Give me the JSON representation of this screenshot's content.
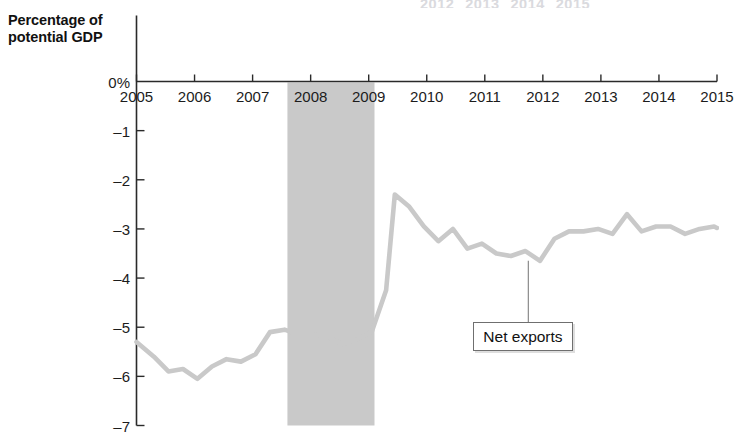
{
  "chart_data": {
    "type": "line",
    "title": "",
    "ylabel": "Percentage of potential GDP",
    "xlabel": "",
    "ylim": [
      -7,
      0
    ],
    "xlim": [
      2005,
      2015
    ],
    "grid": false,
    "legend_position": "inline-callout",
    "y_ticks": [
      "0%",
      "–1",
      "–2",
      "–3",
      "–4",
      "–5",
      "–6",
      "–7"
    ],
    "y_tick_values": [
      0,
      -1,
      -2,
      -3,
      -4,
      -5,
      -6,
      -7
    ],
    "x_ticks": [
      "2005",
      "2006",
      "2007",
      "2008",
      "2009",
      "2010",
      "2011",
      "2012",
      "2013",
      "2014",
      "2015"
    ],
    "x_tick_values": [
      2005,
      2006,
      2007,
      2008,
      2009,
      2010,
      2011,
      2012,
      2013,
      2014,
      2015
    ],
    "series": [
      {
        "name": "Net exports",
        "color": "#c9c9c9",
        "x": [
          2005.0,
          2005.3,
          2005.55,
          2005.8,
          2006.05,
          2006.3,
          2006.55,
          2006.8,
          2007.05,
          2007.3,
          2007.55,
          2007.8,
          2008.05,
          2008.3,
          2008.55,
          2008.8,
          2009.05,
          2009.3,
          2009.45,
          2009.7,
          2009.95,
          2010.2,
          2010.45,
          2010.7,
          2010.95,
          2011.2,
          2011.45,
          2011.7,
          2011.95,
          2012.2,
          2012.45,
          2012.7,
          2012.95,
          2013.2,
          2013.45,
          2013.7,
          2013.95,
          2014.2,
          2014.45,
          2014.7,
          2014.95,
          2015.0
        ],
        "y": [
          -5.3,
          -5.6,
          -5.9,
          -5.85,
          -6.05,
          -5.8,
          -5.65,
          -5.7,
          -5.55,
          -5.1,
          -5.05,
          -5.15,
          -5.15,
          -5.2,
          -5.35,
          -5.25,
          -5.1,
          -4.25,
          -2.3,
          -2.55,
          -2.95,
          -3.25,
          -3.0,
          -3.4,
          -3.3,
          -3.5,
          -3.55,
          -3.45,
          -3.65,
          -3.2,
          -3.05,
          -3.05,
          -3.0,
          -3.1,
          -2.7,
          -3.05,
          -2.95,
          -2.95,
          -3.1,
          -3.0,
          -2.95,
          -2.98
        ]
      }
    ],
    "annotations": [
      {
        "text": "Net exports",
        "type": "callout-box",
        "anchor_x": 2011.75,
        "anchor_y": -3.65
      }
    ],
    "shaded_regions": [
      {
        "name": "recession-band",
        "x_start": 2007.6,
        "x_end": 2009.1,
        "color": "#c9c9c9"
      }
    ],
    "ghost_top_labels": [
      "2012",
      "2013",
      "2014",
      "2015"
    ]
  },
  "axis_title": {
    "line1": "Percentage of",
    "line2": "potential GDP"
  }
}
